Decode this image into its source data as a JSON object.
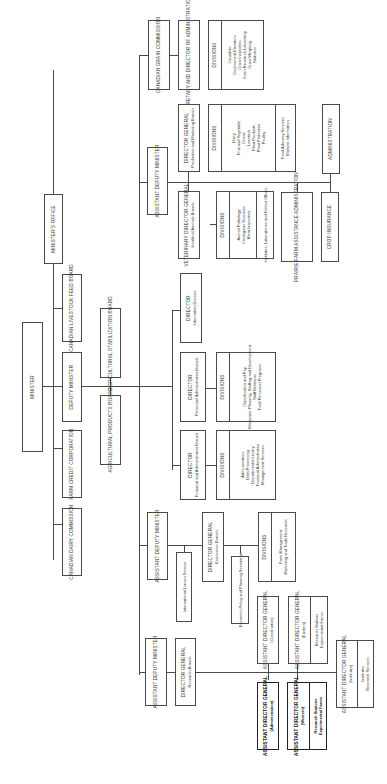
{
  "diagram": {
    "orientation": "rotated 90deg counter-clockwise (landscape org chart on portrait page)",
    "type": "organizational chart",
    "nodes": {
      "minister": {
        "title": "MINISTER"
      },
      "ministers_office": {
        "title": "MINISTER'S OFFICE"
      },
      "canadian_livestock_feed_board": {
        "title": "CANADIAN LIVESTOCK FEED BOARD"
      },
      "deputy_minister": {
        "title": "DEPUTY MINISTER"
      },
      "farm_credit_corporation": {
        "title": "FARM CREDIT CORPORATION"
      },
      "canadian_dairy_commission": {
        "title": "CANADIAN DAIRY COMMISSION"
      },
      "agricultural_stabilization_board": {
        "title": "AGRICULTURAL STABILIZATION BOARD"
      },
      "agricultural_products_board": {
        "title": "AGRICULTURAL PRODUCTS BOARD"
      },
      "canadian_grain_commission": {
        "title": "CANADIAN GRAIN COMMISSION"
      },
      "secretary_director_admin": {
        "title": "SECRETARY AND DIRECTOR OF ADMINISTRATION"
      },
      "grain_divisions": {
        "title": "DIVISIONS",
        "items": [
          "Canadian",
          "Government Elevators",
          "Grain Inspection",
          "Grain Research Laboratory",
          "Grain Weighing",
          "Statistics"
        ]
      },
      "adm_production": {
        "title": "ASSISTANT DEPUTY MINISTER"
      },
      "dg_production_marketing": {
        "title": "DIRECTOR GENERAL",
        "subtitle": "Production and Marketing Branch"
      },
      "production_divisions": {
        "title": "DIVISIONS",
        "items": [
          "Dairy",
          "Fruit and Vegetable",
          "Grains",
          "Livestock",
          "Plant Products",
          "Plant Protection",
          "Poultry"
        ],
        "extra": [
          "Food Advisory Services",
          "Markets Information"
        ]
      },
      "administration": {
        "title": "ADMINISTRATION"
      },
      "veterinary_dg": {
        "title": "VETERINARY DIRECTOR GENERAL",
        "subtitle": "Health of Animals Branch"
      },
      "health_divisions": {
        "title": "DIVISIONS",
        "items": [
          "Animal Pathology",
          "Contagious Diseases",
          "Meat Inspection"
        ],
        "extra": [
          "Institutes, Laboratories and District Offices"
        ]
      },
      "pfaa": {
        "title": "PRAIRIE FARM ASSISTANCE ADMINISTRATION"
      },
      "crop_insurance": {
        "title": "CROP INSURANCE"
      },
      "director_information": {
        "title": "DIRECTOR",
        "subtitle": "Information Division"
      },
      "director_personnel": {
        "title": "DIRECTOR",
        "subtitle": "Personnel Administration Branch"
      },
      "personnel_divisions": {
        "title": "DIVISIONS",
        "items": [
          "Classification and Pay",
          "Manpower Planning, Staffing and Development",
          "Staff Relations",
          "Field Personnel Programs"
        ]
      },
      "director_financial": {
        "title": "DIRECTOR",
        "subtitle": "Financial and Administration Branch"
      },
      "financial_divisions": {
        "title": "DIVISIONS",
        "items": [
          "Administration",
          "Data Processing",
          "Departmental Library",
          "Financial Administration",
          "Management Services"
        ]
      },
      "adm_economics": {
        "title": "ASSISTANT DEPUTY MINISTER"
      },
      "international_liaison": {
        "title": "International Liaison Service"
      },
      "dg_economics": {
        "title": "DIRECTOR GENERAL",
        "subtitle": "Economics Branch"
      },
      "economic_policy": {
        "title": "Economic Policy and Planning Secretariat"
      },
      "economics_divisions": {
        "title": "DIVISIONS",
        "items": [
          "Farm Management",
          "Marketing and Trade Research"
        ]
      },
      "adm_research": {
        "title": "ASSISTANT DEPUTY MINISTER"
      },
      "dg_research": {
        "title": "DIRECTOR GENERAL",
        "subtitle": "Research Branch"
      },
      "adg_coordination": {
        "title": "ASSISTANT DIRECTOR GENERAL",
        "subtitle": "(Coordination)"
      },
      "adg_eastern": {
        "title": "ASSISTANT DIRECTOR GENERAL",
        "subtitle": "(Eastern)",
        "extra": [
          "Research Stations",
          "Experimental Farms"
        ]
      },
      "adg_institutes": {
        "title": "ASSISTANT DIRECTOR GENERAL",
        "subtitle": "(Institutes)",
        "extra": [
          "Institutes",
          "Research Services"
        ]
      },
      "adg_administration": {
        "title": "ASSISTANT DIRECTOR GENERAL",
        "subtitle": "(Administration)"
      },
      "adg_western": {
        "title": "ASSISTANT DIRECTOR GENERAL",
        "subtitle": "(Western)",
        "extra": [
          "Research Stations",
          "Experimental Farms"
        ]
      }
    }
  }
}
